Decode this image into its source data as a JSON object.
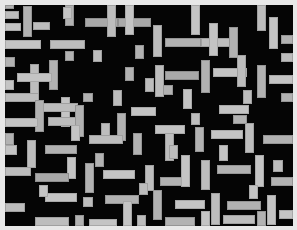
{
  "figure": {
    "width": 297,
    "height": 230,
    "background_color": "#e8e8e8",
    "plot_background_color": "#050505",
    "rect_fill_color": "#b8b8b8",
    "rect_edge_color": "#9a9a9a",
    "plot_area": {
      "left": 5,
      "top": 5,
      "width": 288,
      "height": 221
    }
  },
  "chart_data": {
    "type": "scatter",
    "subtitle": "",
    "xlabel": "",
    "ylabel": "",
    "xlim": [
      0,
      288
    ],
    "ylim": [
      0,
      221
    ],
    "grid": false,
    "legend": null,
    "annotations": [],
    "tick_labels_x": [],
    "tick_labels_y": [],
    "units": "pixels",
    "series": [
      {
        "name": "horizontal",
        "count": 58,
        "color": "#b8b8b8",
        "orientation": "horizontal"
      },
      {
        "name": "vertical",
        "count": 52,
        "color": "#b8b8b8",
        "orientation": "vertical"
      }
    ],
    "rectangles": [
      {
        "x": 0,
        "y": 6,
        "w": 14,
        "h": 8,
        "o": "h",
        "t": "tone-a"
      },
      {
        "x": 18,
        "y": 1,
        "w": 9,
        "h": 31,
        "o": "v",
        "t": "tone-b"
      },
      {
        "x": 0,
        "y": 18,
        "w": 16,
        "h": 8,
        "o": "h",
        "t": "tone-c"
      },
      {
        "x": 28,
        "y": 17,
        "w": 17,
        "h": 8,
        "o": "h",
        "t": "tone-a"
      },
      {
        "x": 0,
        "y": 35,
        "w": 36,
        "h": 9,
        "o": "h",
        "t": "tone-c"
      },
      {
        "x": 60,
        "y": 0,
        "w": 9,
        "h": 21,
        "o": "v",
        "t": "tone-b"
      },
      {
        "x": 45,
        "y": 35,
        "w": 35,
        "h": 9,
        "o": "h",
        "t": "tone-a"
      },
      {
        "x": 60,
        "y": 46,
        "w": 9,
        "h": 10,
        "o": "v",
        "t": "tone-b"
      },
      {
        "x": 80,
        "y": 13,
        "w": 33,
        "h": 9,
        "o": "h",
        "t": "tone-d"
      },
      {
        "x": 102,
        "y": 0,
        "w": 9,
        "h": 32,
        "o": "v",
        "t": "tone-a"
      },
      {
        "x": 113,
        "y": 13,
        "w": 33,
        "h": 9,
        "o": "h",
        "t": "tone-d"
      },
      {
        "x": 120,
        "y": 0,
        "w": 9,
        "h": 30,
        "o": "v",
        "t": "tone-c"
      },
      {
        "x": 0,
        "y": 52,
        "w": 10,
        "h": 10,
        "o": "v",
        "t": "tone-b"
      },
      {
        "x": 25,
        "y": 59,
        "w": 9,
        "h": 34,
        "o": "v",
        "t": "tone-a"
      },
      {
        "x": 44,
        "y": 55,
        "w": 9,
        "h": 30,
        "o": "v",
        "t": "tone-b"
      },
      {
        "x": 12,
        "y": 68,
        "w": 35,
        "h": 9,
        "o": "h",
        "t": "tone-c"
      },
      {
        "x": 0,
        "y": 88,
        "w": 34,
        "h": 9,
        "o": "h",
        "t": "tone-a"
      },
      {
        "x": 30,
        "y": 95,
        "w": 9,
        "h": 32,
        "o": "v",
        "t": "tone-b"
      },
      {
        "x": 56,
        "y": 92,
        "w": 9,
        "h": 30,
        "o": "v",
        "t": "tone-c"
      },
      {
        "x": 38,
        "y": 98,
        "w": 35,
        "h": 9,
        "o": "h",
        "t": "tone-a"
      },
      {
        "x": 78,
        "y": 88,
        "w": 10,
        "h": 9,
        "o": "h",
        "t": "tone-b"
      },
      {
        "x": 0,
        "y": 113,
        "w": 33,
        "h": 9,
        "o": "h",
        "t": "tone-c"
      },
      {
        "x": 43,
        "y": 112,
        "w": 33,
        "h": 9,
        "o": "h",
        "t": "tone-a"
      },
      {
        "x": 70,
        "y": 100,
        "w": 9,
        "h": 32,
        "o": "v",
        "t": "tone-b"
      },
      {
        "x": 148,
        "y": 20,
        "w": 9,
        "h": 32,
        "o": "v",
        "t": "tone-a"
      },
      {
        "x": 186,
        "y": 0,
        "w": 9,
        "h": 30,
        "o": "v",
        "t": "tone-c"
      },
      {
        "x": 160,
        "y": 33,
        "w": 36,
        "h": 9,
        "o": "h",
        "t": "tone-b"
      },
      {
        "x": 196,
        "y": 33,
        "w": 30,
        "h": 9,
        "o": "h",
        "t": "tone-a"
      },
      {
        "x": 204,
        "y": 18,
        "w": 9,
        "h": 33,
        "o": "v",
        "t": "tone-c"
      },
      {
        "x": 224,
        "y": 22,
        "w": 9,
        "h": 31,
        "o": "v",
        "t": "tone-b"
      },
      {
        "x": 252,
        "y": 0,
        "w": 9,
        "h": 26,
        "o": "v",
        "t": "tone-a"
      },
      {
        "x": 264,
        "y": 12,
        "w": 9,
        "h": 32,
        "o": "v",
        "t": "tone-c"
      },
      {
        "x": 276,
        "y": 30,
        "w": 12,
        "h": 9,
        "o": "h",
        "t": "tone-b"
      },
      {
        "x": 150,
        "y": 60,
        "w": 9,
        "h": 32,
        "o": "v",
        "t": "tone-a"
      },
      {
        "x": 160,
        "y": 66,
        "w": 34,
        "h": 9,
        "o": "h",
        "t": "tone-d"
      },
      {
        "x": 196,
        "y": 55,
        "w": 9,
        "h": 33,
        "o": "v",
        "t": "tone-b"
      },
      {
        "x": 208,
        "y": 63,
        "w": 34,
        "h": 9,
        "o": "h",
        "t": "tone-c"
      },
      {
        "x": 232,
        "y": 50,
        "w": 9,
        "h": 32,
        "o": "v",
        "t": "tone-a"
      },
      {
        "x": 252,
        "y": 60,
        "w": 9,
        "h": 33,
        "o": "v",
        "t": "tone-b"
      },
      {
        "x": 264,
        "y": 70,
        "w": 24,
        "h": 9,
        "o": "h",
        "t": "tone-c"
      },
      {
        "x": 140,
        "y": 73,
        "w": 9,
        "h": 14,
        "o": "v",
        "t": "tone-a"
      },
      {
        "x": 158,
        "y": 80,
        "w": 10,
        "h": 10,
        "o": "v",
        "t": "tone-b"
      },
      {
        "x": 178,
        "y": 84,
        "w": 9,
        "h": 20,
        "o": "v",
        "t": "tone-c"
      },
      {
        "x": 96,
        "y": 118,
        "w": 9,
        "h": 14,
        "o": "v",
        "t": "tone-a"
      },
      {
        "x": 112,
        "y": 108,
        "w": 9,
        "h": 28,
        "o": "v",
        "t": "tone-b"
      },
      {
        "x": 126,
        "y": 102,
        "w": 25,
        "h": 9,
        "o": "h",
        "t": "tone-c"
      },
      {
        "x": 84,
        "y": 130,
        "w": 34,
        "h": 9,
        "o": "h",
        "t": "tone-a"
      },
      {
        "x": 128,
        "y": 128,
        "w": 9,
        "h": 22,
        "o": "v",
        "t": "tone-b"
      },
      {
        "x": 150,
        "y": 120,
        "w": 30,
        "h": 9,
        "o": "h",
        "t": "tone-c"
      },
      {
        "x": 160,
        "y": 128,
        "w": 9,
        "h": 28,
        "o": "v",
        "t": "tone-a"
      },
      {
        "x": 190,
        "y": 122,
        "w": 9,
        "h": 25,
        "o": "v",
        "t": "tone-b"
      },
      {
        "x": 206,
        "y": 125,
        "w": 32,
        "h": 9,
        "o": "h",
        "t": "tone-c"
      },
      {
        "x": 240,
        "y": 118,
        "w": 9,
        "h": 30,
        "o": "v",
        "t": "tone-a"
      },
      {
        "x": 258,
        "y": 130,
        "w": 30,
        "h": 9,
        "o": "h",
        "t": "tone-b"
      },
      {
        "x": 0,
        "y": 140,
        "w": 12,
        "h": 10,
        "o": "v",
        "t": "tone-c"
      },
      {
        "x": 22,
        "y": 135,
        "w": 9,
        "h": 28,
        "o": "v",
        "t": "tone-a"
      },
      {
        "x": 40,
        "y": 140,
        "w": 32,
        "h": 9,
        "o": "h",
        "t": "tone-b"
      },
      {
        "x": 62,
        "y": 152,
        "w": 9,
        "h": 22,
        "o": "v",
        "t": "tone-c"
      },
      {
        "x": 0,
        "y": 162,
        "w": 26,
        "h": 9,
        "o": "h",
        "t": "tone-a"
      },
      {
        "x": 30,
        "y": 168,
        "w": 34,
        "h": 9,
        "o": "h",
        "t": "tone-d"
      },
      {
        "x": 80,
        "y": 158,
        "w": 9,
        "h": 30,
        "o": "v",
        "t": "tone-b"
      },
      {
        "x": 98,
        "y": 165,
        "w": 32,
        "h": 9,
        "o": "h",
        "t": "tone-c"
      },
      {
        "x": 140,
        "y": 160,
        "w": 9,
        "h": 26,
        "o": "v",
        "t": "tone-a"
      },
      {
        "x": 155,
        "y": 172,
        "w": 28,
        "h": 9,
        "o": "h",
        "t": "tone-b"
      },
      {
        "x": 176,
        "y": 150,
        "w": 9,
        "h": 32,
        "o": "v",
        "t": "tone-c"
      },
      {
        "x": 196,
        "y": 155,
        "w": 9,
        "h": 30,
        "o": "v",
        "t": "tone-a"
      },
      {
        "x": 212,
        "y": 160,
        "w": 34,
        "h": 9,
        "o": "h",
        "t": "tone-b"
      },
      {
        "x": 250,
        "y": 150,
        "w": 9,
        "h": 32,
        "o": "v",
        "t": "tone-c"
      },
      {
        "x": 268,
        "y": 155,
        "w": 10,
        "h": 12,
        "o": "v",
        "t": "tone-a"
      },
      {
        "x": 266,
        "y": 172,
        "w": 22,
        "h": 9,
        "o": "h",
        "t": "tone-b"
      },
      {
        "x": 40,
        "y": 188,
        "w": 32,
        "h": 9,
        "o": "h",
        "t": "tone-c"
      },
      {
        "x": 78,
        "y": 192,
        "w": 10,
        "h": 10,
        "o": "v",
        "t": "tone-a"
      },
      {
        "x": 100,
        "y": 190,
        "w": 34,
        "h": 9,
        "o": "h",
        "t": "tone-b"
      },
      {
        "x": 118,
        "y": 196,
        "w": 9,
        "h": 25,
        "o": "v",
        "t": "tone-c"
      },
      {
        "x": 0,
        "y": 198,
        "w": 20,
        "h": 9,
        "o": "h",
        "t": "tone-a"
      },
      {
        "x": 148,
        "y": 185,
        "w": 9,
        "h": 30,
        "o": "v",
        "t": "tone-b"
      },
      {
        "x": 170,
        "y": 195,
        "w": 30,
        "h": 9,
        "o": "h",
        "t": "tone-c"
      },
      {
        "x": 206,
        "y": 188,
        "w": 9,
        "h": 32,
        "o": "v",
        "t": "tone-a"
      },
      {
        "x": 222,
        "y": 196,
        "w": 34,
        "h": 9,
        "o": "h",
        "t": "tone-b"
      },
      {
        "x": 262,
        "y": 190,
        "w": 9,
        "h": 30,
        "o": "v",
        "t": "tone-c"
      },
      {
        "x": 30,
        "y": 212,
        "w": 34,
        "h": 9,
        "o": "h",
        "t": "tone-a"
      },
      {
        "x": 70,
        "y": 210,
        "w": 9,
        "h": 11,
        "o": "v",
        "t": "tone-b"
      },
      {
        "x": 84,
        "y": 214,
        "w": 28,
        "h": 7,
        "o": "h",
        "t": "tone-c"
      },
      {
        "x": 132,
        "y": 210,
        "w": 9,
        "h": 11,
        "o": "v",
        "t": "tone-a"
      },
      {
        "x": 160,
        "y": 212,
        "w": 30,
        "h": 9,
        "o": "h",
        "t": "tone-b"
      },
      {
        "x": 196,
        "y": 206,
        "w": 9,
        "h": 15,
        "o": "v",
        "t": "tone-c"
      },
      {
        "x": 218,
        "y": 210,
        "w": 32,
        "h": 9,
        "o": "h",
        "t": "tone-a"
      },
      {
        "x": 252,
        "y": 206,
        "w": 9,
        "h": 15,
        "o": "v",
        "t": "tone-b"
      },
      {
        "x": 274,
        "y": 205,
        "w": 14,
        "h": 9,
        "o": "h",
        "t": "tone-c"
      },
      {
        "x": 88,
        "y": 45,
        "w": 9,
        "h": 12,
        "o": "v",
        "t": "tone-a"
      },
      {
        "x": 130,
        "y": 40,
        "w": 9,
        "h": 14,
        "o": "v",
        "t": "tone-b"
      },
      {
        "x": 0,
        "y": 75,
        "w": 9,
        "h": 10,
        "o": "v",
        "t": "tone-c"
      },
      {
        "x": 238,
        "y": 85,
        "w": 9,
        "h": 14,
        "o": "v",
        "t": "tone-a"
      },
      {
        "x": 276,
        "y": 88,
        "w": 12,
        "h": 9,
        "o": "h",
        "t": "tone-b"
      },
      {
        "x": 214,
        "y": 100,
        "w": 30,
        "h": 9,
        "o": "h",
        "t": "tone-c"
      },
      {
        "x": 108,
        "y": 85,
        "w": 9,
        "h": 16,
        "o": "v",
        "t": "tone-a"
      },
      {
        "x": 0,
        "y": 128,
        "w": 9,
        "h": 12,
        "o": "v",
        "t": "tone-b"
      },
      {
        "x": 66,
        "y": 120,
        "w": 9,
        "h": 16,
        "o": "v",
        "t": "tone-c"
      },
      {
        "x": 186,
        "y": 108,
        "w": 9,
        "h": 12,
        "o": "v",
        "t": "tone-a"
      },
      {
        "x": 228,
        "y": 110,
        "w": 14,
        "h": 9,
        "o": "h",
        "t": "tone-b"
      },
      {
        "x": 34,
        "y": 180,
        "w": 9,
        "h": 12,
        "o": "v",
        "t": "tone-c"
      },
      {
        "x": 134,
        "y": 178,
        "w": 9,
        "h": 12,
        "o": "v",
        "t": "tone-a"
      },
      {
        "x": 90,
        "y": 148,
        "w": 9,
        "h": 14,
        "o": "v",
        "t": "tone-b"
      },
      {
        "x": 58,
        "y": 2,
        "w": 9,
        "h": 12,
        "o": "v",
        "t": "tone-c"
      },
      {
        "x": 276,
        "y": 48,
        "w": 12,
        "h": 9,
        "o": "h",
        "t": "tone-a"
      },
      {
        "x": 0,
        "y": 0,
        "w": 9,
        "h": 4,
        "o": "v",
        "t": "tone-b"
      },
      {
        "x": 244,
        "y": 180,
        "w": 9,
        "h": 14,
        "o": "v",
        "t": "tone-c"
      },
      {
        "x": 164,
        "y": 140,
        "w": 9,
        "h": 14,
        "o": "v",
        "t": "tone-a"
      },
      {
        "x": 120,
        "y": 62,
        "w": 9,
        "h": 14,
        "o": "v",
        "t": "tone-b"
      },
      {
        "x": 214,
        "y": 140,
        "w": 9,
        "h": 16,
        "o": "v",
        "t": "tone-c"
      }
    ]
  }
}
